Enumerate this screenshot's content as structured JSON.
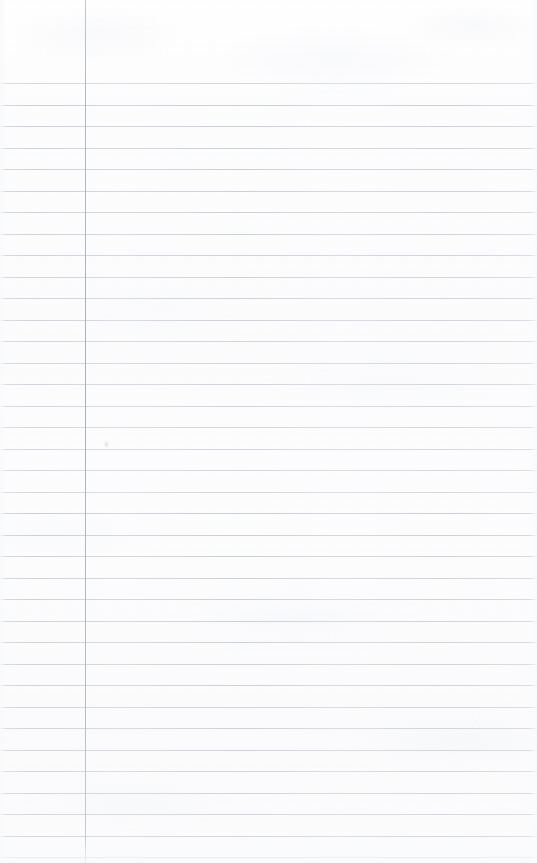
{
  "document": {
    "kind": "scanned-ruled-notebook-page",
    "title": "Ruled Notebook Page",
    "content_text": "",
    "page_width": 537,
    "page_height": 863,
    "background_color": "#fdfdfe"
  },
  "ruling": {
    "line_color": "#d6d9de",
    "line_thickness_px": 1,
    "first_line_y": 83,
    "line_spacing_px": 21.5,
    "line_count": 37,
    "line_left_x": 0,
    "line_right_x": 537,
    "line_ys": [
      83,
      104.5,
      126,
      147.5,
      169,
      190.5,
      212,
      233.5,
      255,
      276.5,
      298,
      319.5,
      341,
      362.5,
      384,
      405.5,
      427,
      448.5,
      470,
      491.5,
      513,
      534.5,
      556,
      577.5,
      599,
      620.5,
      642,
      663.5,
      685,
      706.5,
      728,
      749.5,
      771,
      792.5,
      814,
      835.5,
      857
    ]
  },
  "margin_rule": {
    "color": "#aeb3bd",
    "thickness_px": 1,
    "x": 85,
    "top_y": 0,
    "bottom_y": 863,
    "label": "left-margin-line"
  },
  "artifacts": {
    "marks": [
      {
        "name": "scan-speck",
        "x": 104,
        "y": 441
      }
    ]
  }
}
